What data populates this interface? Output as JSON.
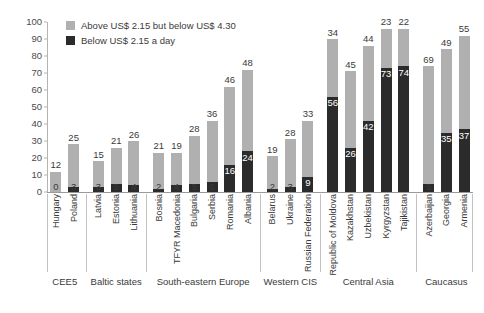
{
  "chart_data": {
    "type": "bar",
    "title": "",
    "subtitle": "",
    "xlabel": "",
    "ylabel": "",
    "ylim": [
      0,
      100
    ],
    "yticks": [
      0,
      10,
      20,
      30,
      40,
      50,
      60,
      70,
      80,
      90,
      100
    ],
    "grid": false,
    "stacked": true,
    "legend_position": "top-left",
    "colors": {
      "above": "#b0b0b0",
      "below": "#2b2b2b",
      "axis": "#b4b4b4",
      "text": "#3a3a3a",
      "background": "#ffffff"
    },
    "legend": [
      {
        "key": "above",
        "label": "Above US$ 2.15 but below US$ 4.30",
        "color": "#b0b0b0"
      },
      {
        "key": "below",
        "label": "Below US$ 2.15 a day",
        "color": "#2b2b2b"
      }
    ],
    "categories": [
      "Hungary",
      "Poland",
      "Latvia",
      "Estonia",
      "Lithuania",
      "Bosnia",
      "TFYR Macedonia",
      "Bulgaria",
      "Serbia",
      "Romania",
      "Albania",
      "Belarus",
      "Ukraine",
      "Russian Federation",
      "Republic of Moldova",
      "Kazakhstan",
      "Uzbekistan",
      "Kyrgyzstan",
      "Tajikistan",
      "Azerbaijan",
      "Georgia",
      "Armenia"
    ],
    "series": [
      {
        "name": "Above US$ 2.15 but below US$ 4.30",
        "key": "above",
        "values": [
          12,
          25,
          15,
          21,
          26,
          21,
          19,
          28,
          36,
          46,
          48,
          19,
          28,
          33,
          34,
          45,
          44,
          23,
          22,
          69,
          49,
          55
        ]
      },
      {
        "name": "Below US$ 2.15 a day",
        "key": "below",
        "values": [
          0,
          3,
          3,
          5,
          4,
          2,
          4,
          5,
          6,
          16,
          24,
          2,
          3,
          9,
          56,
          26,
          42,
          73,
          74,
          5,
          35,
          37
        ]
      }
    ],
    "groups": [
      {
        "label": "CEE5",
        "start": 0,
        "count": 2
      },
      {
        "label": "Baltic states",
        "start": 2,
        "count": 3
      },
      {
        "label": "South-eastern Europe",
        "start": 5,
        "count": 6
      },
      {
        "label": "Western CIS",
        "start": 11,
        "count": 3
      },
      {
        "label": "Central Asia",
        "start": 14,
        "count": 5
      },
      {
        "label": "Caucasus",
        "start": 19,
        "count": 3
      }
    ]
  }
}
